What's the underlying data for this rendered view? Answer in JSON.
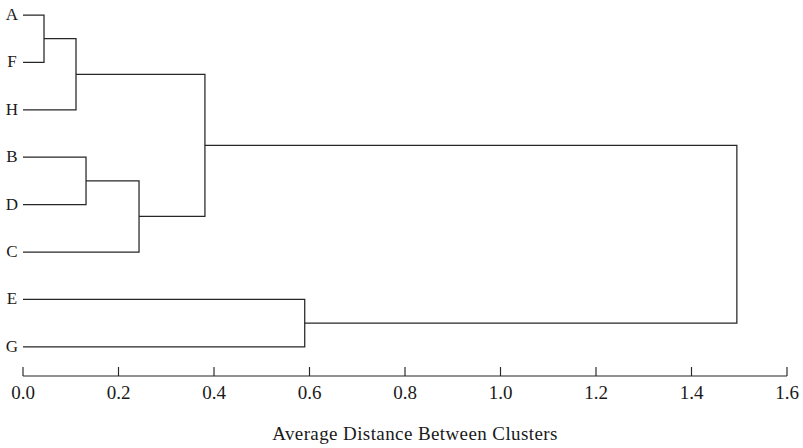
{
  "chart_data": {
    "type": "dendrogram",
    "title": "",
    "xlabel": "Average  Distance  Between  Clusters",
    "ylabel": "",
    "xlim": [
      0.0,
      1.6
    ],
    "grid": false,
    "legend": "none",
    "orientation": "horizontal-left-to-right",
    "line_color": "#262626",
    "background_color": "#ffffff",
    "leaves": [
      {
        "label": "A",
        "order": 0
      },
      {
        "label": "F",
        "order": 1
      },
      {
        "label": "H",
        "order": 2
      },
      {
        "label": "B",
        "order": 3
      },
      {
        "label": "D",
        "order": 4
      },
      {
        "label": "C",
        "order": 5
      },
      {
        "label": "E",
        "order": 6
      },
      {
        "label": "G",
        "order": 7
      }
    ],
    "xticks": [
      0.0,
      0.2,
      0.4,
      0.6,
      0.8,
      1.0,
      1.2,
      1.4,
      1.6
    ],
    "xticklabels": [
      "0.0",
      "0.2",
      "0.4",
      "0.6",
      "0.8",
      "1.0",
      "1.2",
      "1.4",
      "1.6"
    ],
    "merges": [
      {
        "id": "m1",
        "children": [
          "A",
          "F"
        ],
        "distance": 0.044
      },
      {
        "id": "m2",
        "children": [
          "m1",
          "H"
        ],
        "distance": 0.111
      },
      {
        "id": "m3",
        "children": [
          "B",
          "D"
        ],
        "distance": 0.132
      },
      {
        "id": "m4",
        "children": [
          "m3",
          "C"
        ],
        "distance": 0.243
      },
      {
        "id": "m5",
        "children": [
          "m2",
          "m4"
        ],
        "distance": 0.381
      },
      {
        "id": "m6",
        "children": [
          "E",
          "G"
        ],
        "distance": 0.59
      },
      {
        "id": "m7",
        "children": [
          "m5",
          "m6"
        ],
        "distance": 1.495
      }
    ]
  },
  "axis": {
    "label": "Average  Distance  Between  Clusters"
  }
}
